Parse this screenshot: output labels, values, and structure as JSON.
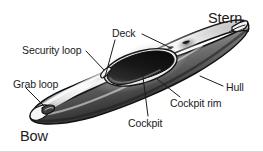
{
  "figure": {
    "view": "three-quarter perspective, bow at lower left, stern at upper right",
    "style": "black-and-white airbrushed line illustration",
    "background_color": "#ffffff",
    "ink_color": "#1b1b1b",
    "leader_color": "#1b1b1b",
    "border": {
      "bottom_rule_color": "#d8d8d8"
    }
  },
  "labels": [
    {
      "id": "stern",
      "text": "Stern",
      "size": "big",
      "x": 208,
      "y": 11,
      "has_leader": false
    },
    {
      "id": "deck",
      "text": "Deck",
      "size": "small",
      "x": 112,
      "y": 28,
      "has_leader": true,
      "leader": {
        "x1": 142,
        "y1": 34,
        "x2": 171,
        "y2": 48
      }
    },
    {
      "id": "security-loop",
      "text": "Security loop",
      "size": "small",
      "x": 22,
      "y": 45,
      "has_leader": true,
      "leader": {
        "x1": 86,
        "y1": 51,
        "x2": 104,
        "y2": 70
      }
    },
    {
      "id": "grab-loop",
      "text": "Grab loop",
      "size": "small",
      "x": 13,
      "y": 79,
      "has_leader": true,
      "leader": {
        "x1": 26,
        "y1": 87,
        "x2": 44,
        "y2": 105
      }
    },
    {
      "id": "bow",
      "text": "Bow",
      "size": "big",
      "x": 20,
      "y": 129,
      "has_leader": false
    },
    {
      "id": "cockpit",
      "text": "Cockpit",
      "size": "small",
      "x": 128,
      "y": 118,
      "has_leader": true,
      "leader": {
        "x1": 148,
        "y1": 116,
        "x2": 142,
        "y2": 69
      }
    },
    {
      "id": "cockpit-rim",
      "text": "Cockpit rim",
      "size": "small",
      "x": 170,
      "y": 98,
      "has_leader": true,
      "leader": {
        "x1": 180,
        "y1": 96,
        "x2": 157,
        "y2": 78
      }
    },
    {
      "id": "hull",
      "text": "Hull",
      "size": "small",
      "x": 226,
      "y": 82,
      "has_leader": true,
      "leader": {
        "x1": 223,
        "y1": 86,
        "x2": 200,
        "y2": 76
      }
    }
  ],
  "parts": [
    {
      "id": "deck",
      "name": "Deck",
      "description": "upper surface of the kayak"
    },
    {
      "id": "hull",
      "name": "Hull",
      "description": "lower body of the kayak"
    },
    {
      "id": "cockpit",
      "name": "Cockpit",
      "description": "dark kidney-shaped opening in the deck"
    },
    {
      "id": "cockpit-rim",
      "name": "Cockpit rim",
      "description": "raised coaming around the cockpit opening"
    },
    {
      "id": "security-loop",
      "name": "Security loop",
      "description": "small loop on the foredeck"
    },
    {
      "id": "grab-loop",
      "name": "Grab loop",
      "description": "carry loop at the bow tip"
    },
    {
      "id": "bow",
      "name": "Bow",
      "description": "front end of the kayak (lower left)"
    },
    {
      "id": "stern",
      "name": "Stern",
      "description": "rear end of the kayak (upper right)"
    }
  ]
}
